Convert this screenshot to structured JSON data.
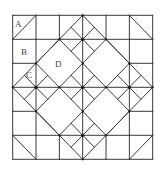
{
  "diagram": {
    "type": "quilt-block-geometry",
    "grid": {
      "cols": 6,
      "rows": 6
    },
    "colors": {
      "line": "#3a3a3a",
      "vertex": "#1a1a1a",
      "label": "#444444",
      "background": "#ffffff"
    },
    "labels": [
      {
        "id": "A",
        "text": "A",
        "x": 18,
        "y": 24
      },
      {
        "id": "B",
        "text": "B",
        "x": 24,
        "y": 52
      },
      {
        "id": "C",
        "text": "C",
        "x": 30,
        "y": 75
      },
      {
        "id": "D",
        "text": "D",
        "x": 58,
        "y": 64
      }
    ],
    "small_diamond_centers": [
      [
        3,
        1
      ],
      [
        1,
        3
      ],
      [
        3,
        3
      ],
      [
        5,
        3
      ],
      [
        3,
        5
      ]
    ],
    "large_diamond_centers": [
      [
        2,
        2
      ],
      [
        4,
        2
      ],
      [
        2,
        4
      ],
      [
        4,
        4
      ]
    ],
    "outer_diamond": [
      [
        3,
        0
      ],
      [
        6,
        3
      ],
      [
        3,
        6
      ],
      [
        0,
        3
      ]
    ],
    "corner_diagonals": [
      [
        [
          0,
          1
        ],
        [
          1,
          0
        ]
      ],
      [
        [
          5,
          0
        ],
        [
          6,
          1
        ]
      ],
      [
        [
          0,
          5
        ],
        [
          1,
          6
        ]
      ],
      [
        [
          5,
          6
        ],
        [
          6,
          5
        ]
      ]
    ],
    "vertices": [
      [
        3,
        1
      ],
      [
        1,
        3
      ],
      [
        3,
        3
      ],
      [
        5,
        3
      ],
      [
        3,
        5
      ],
      [
        2,
        1
      ],
      [
        4,
        1
      ],
      [
        1,
        2
      ],
      [
        5,
        2
      ],
      [
        3,
        2
      ],
      [
        2,
        3
      ],
      [
        4,
        3
      ],
      [
        3,
        4
      ],
      [
        1,
        4
      ],
      [
        5,
        4
      ],
      [
        2,
        5
      ],
      [
        4,
        5
      ],
      [
        3,
        0
      ],
      [
        0,
        3
      ],
      [
        6,
        3
      ],
      [
        3,
        6
      ]
    ]
  }
}
